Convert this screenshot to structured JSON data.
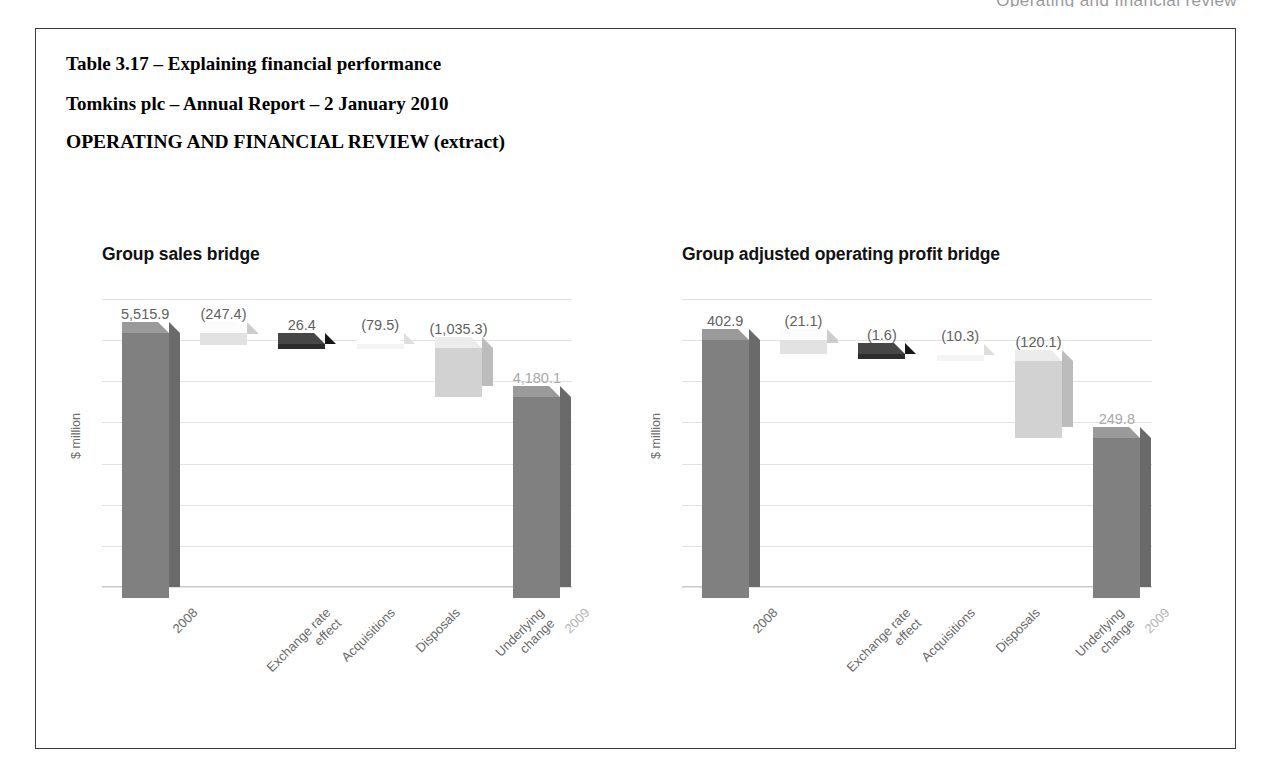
{
  "running_header": "Operating and financial review",
  "heading": {
    "line1": "Table 3.17 – Explaining financial performance",
    "line2": "Tomkins plc – Annual Report – 2 January 2010",
    "line3": "OPERATING AND FINANCIAL REVIEW (extract)"
  },
  "colors": {
    "bar_dark": "#808080",
    "bar_darktop": "#9a9a9a",
    "bar_darkside": "#6e6e6e",
    "bar_near_black": "#2c2c2c",
    "bar_near_black_top": "#4a4a4a",
    "bar_light": "#e2e2e2",
    "bar_lighter": "#f1f1f1",
    "bar_mid_light": "#d2d2d2",
    "grid": "#e2e2e2",
    "label": "#5f5f5f",
    "label_muted": "#a9a9a9",
    "border": "#3a3a3a"
  },
  "chart_data": [
    {
      "type": "bar",
      "subtype": "waterfall",
      "title": "Group sales bridge",
      "ylabel": "$ million",
      "xlabel": "",
      "grid": true,
      "gridlines": 8,
      "ylim": [
        0,
        6000
      ],
      "categories": [
        "2008",
        "Exchange rate\neffect",
        "Acquisitions",
        "Disposals",
        "Underlying\nchange",
        "2009"
      ],
      "labels": [
        "5,515.9",
        "(247.4)",
        "26.4",
        "(79.5)",
        "(1,035.3)",
        "4,180.1"
      ],
      "values": [
        5515.9,
        -247.4,
        26.4,
        -79.5,
        -1035.3,
        4180.1
      ],
      "kinds": [
        "total",
        "delta",
        "delta",
        "delta",
        "delta",
        "total"
      ],
      "cumulative_start": [
        0,
        5515.9,
        5268.5,
        5294.9,
        5215.4,
        0
      ],
      "cumulative_end": [
        5515.9,
        5268.5,
        5294.9,
        5215.4,
        4180.1,
        4180.1
      ],
      "bar_colors": [
        "#808080",
        "#e2e2e2",
        "#2c2c2c",
        "#f4f4f4",
        "#d2d2d2",
        "#808080"
      ]
    },
    {
      "type": "bar",
      "subtype": "waterfall",
      "title": "Group adjusted operating profit bridge",
      "ylabel": "$ million",
      "xlabel": "",
      "grid": true,
      "gridlines": 8,
      "ylim": [
        0,
        450
      ],
      "categories": [
        "2008",
        "Exchange rate\neffect",
        "Acquisitions",
        "Disposals",
        "Underlying\nchange",
        "2009"
      ],
      "labels": [
        "402.9",
        "(21.1)",
        "(1.6)",
        "(10.3)",
        "(120.1)",
        "249.8"
      ],
      "values": [
        402.9,
        -21.1,
        -1.6,
        -10.3,
        -120.1,
        249.8
      ],
      "kinds": [
        "total",
        "delta",
        "delta",
        "delta",
        "delta",
        "total"
      ],
      "cumulative_start": [
        0,
        402.9,
        381.8,
        380.2,
        369.9,
        0
      ],
      "cumulative_end": [
        402.9,
        381.8,
        380.2,
        369.9,
        249.8,
        249.8
      ],
      "bar_colors": [
        "#808080",
        "#e2e2e2",
        "#2c2c2c",
        "#f4f4f4",
        "#d2d2d2",
        "#808080"
      ]
    }
  ]
}
